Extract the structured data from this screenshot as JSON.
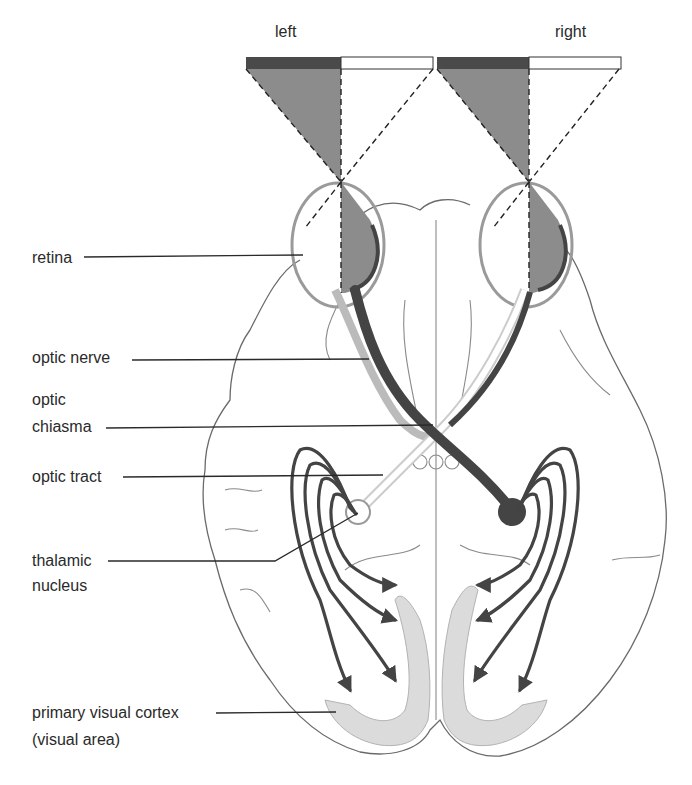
{
  "diagram": {
    "visual_field_labels": {
      "left": "left",
      "right": "right"
    },
    "labels": [
      {
        "id": "retina",
        "lines": [
          "retina"
        ]
      },
      {
        "id": "optic-nerve",
        "lines": [
          "optic nerve"
        ]
      },
      {
        "id": "optic-chiasma",
        "lines": [
          "optic",
          "chiasma"
        ]
      },
      {
        "id": "optic-tract",
        "lines": [
          "optic tract"
        ]
      },
      {
        "id": "thalamic-nucleus",
        "lines": [
          "thalamic",
          "nucleus"
        ]
      },
      {
        "id": "primary-visual-cortex",
        "lines": [
          "primary visual cortex",
          "(visual area)"
        ]
      }
    ],
    "colors": {
      "dark_pathway": "#444444",
      "shaded_field": "#8c8c8c",
      "field_bar_dark": "#4a4a4a",
      "cortex_shade": "#cfcfcf",
      "outline": "#6a6a6a"
    }
  }
}
